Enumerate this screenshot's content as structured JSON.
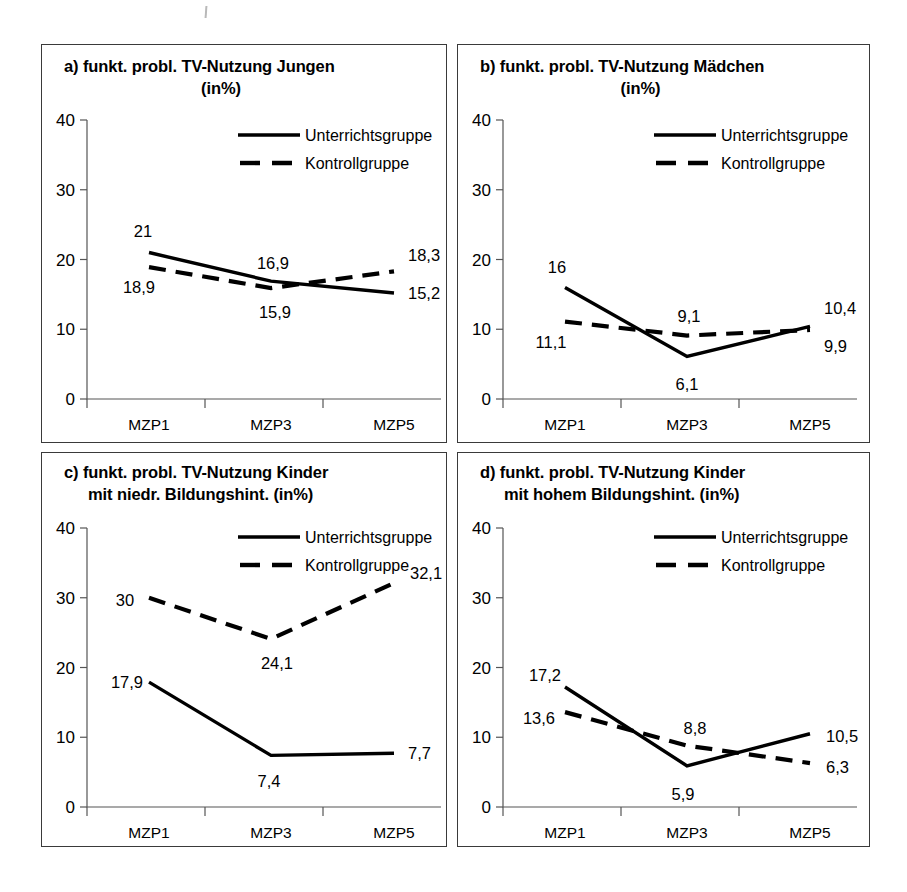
{
  "figure": {
    "axis_ticks_y": [
      "40",
      "30",
      "20",
      "10",
      "0"
    ],
    "x_categories": [
      "MZP1",
      "MZP3",
      "MZP5"
    ],
    "legend": {
      "solid_label": "Unterrichtsgruppe",
      "dashed_label": "Kontrollgruppe"
    }
  },
  "chart_data": [
    {
      "type": "line",
      "panel": "a",
      "title_line1": "a) funkt. probl. TV-Nutzung Jungen",
      "title_line2": "(in%)",
      "categories": [
        "MZP1",
        "MZP3",
        "MZP5"
      ],
      "series": [
        {
          "name": "Unterrichtsgruppe",
          "style": "solid",
          "values": [
            21,
            16.9,
            15.2
          ],
          "labels": [
            "21",
            "16,9",
            "15,2"
          ]
        },
        {
          "name": "Kontrollgruppe",
          "style": "dashed",
          "values": [
            18.9,
            15.9,
            18.3
          ],
          "labels": [
            "18,9",
            "15,9",
            "18,3"
          ]
        }
      ],
      "xlabel": "",
      "ylabel": "",
      "ylim": [
        0,
        40
      ],
      "yticks": [
        0,
        10,
        20,
        30,
        40
      ],
      "grid": false,
      "legend_position": "top-right"
    },
    {
      "type": "line",
      "panel": "b",
      "title_line1": "b) funkt. probl. TV-Nutzung Mädchen",
      "title_line2": "(in%)",
      "categories": [
        "MZP1",
        "MZP3",
        "MZP5"
      ],
      "series": [
        {
          "name": "Unterrichtsgruppe",
          "style": "solid",
          "values": [
            16,
            6.1,
            10.4
          ],
          "labels": [
            "16",
            "6,1",
            "10,4"
          ]
        },
        {
          "name": "Kontrollgruppe",
          "style": "dashed",
          "values": [
            11.1,
            9.1,
            9.9
          ],
          "labels": [
            "11,1",
            "9,1",
            "9,9"
          ]
        }
      ],
      "xlabel": "",
      "ylabel": "",
      "ylim": [
        0,
        40
      ],
      "yticks": [
        0,
        10,
        20,
        30,
        40
      ],
      "grid": false,
      "legend_position": "top-right"
    },
    {
      "type": "line",
      "panel": "c",
      "title_line1": "c)  funkt. probl. TV-Nutzung Kinder",
      "title_line2": "mit niedr. Bildungshint. (in%)",
      "categories": [
        "MZP1",
        "MZP3",
        "MZP5"
      ],
      "series": [
        {
          "name": "Unterrichtsgruppe",
          "style": "solid",
          "values": [
            17.9,
            7.4,
            7.7
          ],
          "labels": [
            "17,9",
            "7,4",
            "7,7"
          ]
        },
        {
          "name": "Kontrollgruppe",
          "style": "dashed",
          "values": [
            30,
            24.1,
            32.1
          ],
          "labels": [
            "30",
            "24,1",
            "32,1"
          ]
        }
      ],
      "xlabel": "",
      "ylabel": "",
      "ylim": [
        0,
        40
      ],
      "yticks": [
        0,
        10,
        20,
        30,
        40
      ],
      "grid": false,
      "legend_position": "top-right"
    },
    {
      "type": "line",
      "panel": "d",
      "title_line1": "d)  funkt. probl. TV-Nutzung Kinder",
      "title_line2": "mit hohem Bildungshint. (in%)",
      "categories": [
        "MZP1",
        "MZP3",
        "MZP5"
      ],
      "series": [
        {
          "name": "Unterrichtsgruppe",
          "style": "solid",
          "values": [
            17.2,
            5.9,
            10.5
          ],
          "labels": [
            "17,2",
            "5,9",
            "10,5"
          ]
        },
        {
          "name": "Kontrollgruppe",
          "style": "dashed",
          "values": [
            13.6,
            8.8,
            6.3
          ],
          "labels": [
            "13,6",
            "8,8",
            "6,3"
          ]
        }
      ],
      "xlabel": "",
      "ylabel": "",
      "ylim": [
        0,
        40
      ],
      "yticks": [
        0,
        10,
        20,
        30,
        40
      ],
      "grid": false,
      "legend_position": "top-right"
    }
  ]
}
